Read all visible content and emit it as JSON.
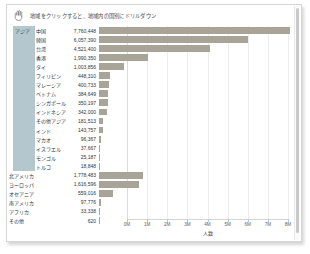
{
  "caption": {
    "icon": "hand-pointer-icon",
    "text": "地域をクリックすると、地域内の国別にドリルダウン"
  },
  "colors": {
    "bar": "#a9a498",
    "region_band": "#b4c7ce",
    "gridline": "#ededed",
    "text": "#2f3438"
  },
  "chart_data": {
    "type": "bar",
    "orientation": "horizontal",
    "title": "",
    "xlabel": "人数",
    "ylabel": "",
    "xlim": [
      0,
      8000000
    ],
    "grid": true,
    "legend": false,
    "tick_labels": [
      "0M",
      "1M",
      "2M",
      "3M",
      "4M",
      "5M",
      "6M",
      "7M",
      "8M"
    ],
    "tick_values": [
      0,
      1000000,
      2000000,
      3000000,
      4000000,
      5000000,
      6000000,
      7000000,
      8000000
    ],
    "group_label": "アジア",
    "categories": [
      "中国",
      "韓国",
      "台湾",
      "香港",
      "タイ",
      "フィリピン",
      "マレーシア",
      "ベトナム",
      "シンガポール",
      "インドネシア",
      "その他アジア",
      "インド",
      "マカオ",
      "イスラエル",
      "モンゴル",
      "トルコ",
      "北アメリカ",
      "ヨーロッパ",
      "オセアニア",
      "南アメリカ",
      "アフリカ",
      "その他"
    ],
    "values": [
      7760448,
      6057390,
      4521400,
      1990350,
      1003856,
      448310,
      400733,
      384649,
      350197,
      342000,
      181513,
      143757,
      96367,
      37667,
      25187,
      18848,
      1778483,
      1616596,
      559016,
      97776,
      33338,
      620
    ],
    "value_labels": [
      "7,760,448",
      "6,057,390",
      "4,521,400",
      "1,990,350",
      "1,003,856",
      "448,310",
      "400,733",
      "384,649",
      "350,197",
      "342,000",
      "181,513",
      "143,757",
      "96,367",
      "37,667",
      "25,187",
      "18,848",
      "1,778,483",
      "1,616,596",
      "559,016",
      "97,776",
      "33,338",
      "620"
    ],
    "group_rows": 16,
    "region_rows": 6
  },
  "scrollbar": {
    "name": "vertical-scrollbar"
  }
}
